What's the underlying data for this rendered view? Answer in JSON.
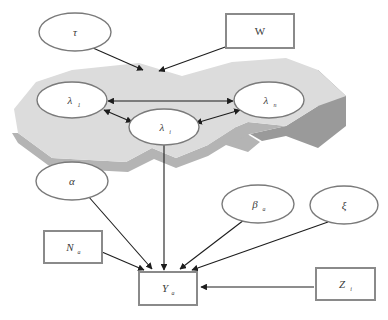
{
  "diagram": {
    "type": "directed-acyclic-graph",
    "canvas": {
      "width": 388,
      "height": 320
    },
    "colors": {
      "background": "#ffffff",
      "plate_top": "#dcdcdc",
      "plate_side": "#b4b4b4",
      "plate_side_dark": "#9a9a9a",
      "node_stroke": "#7a7a7a",
      "box_stroke": "#8a8a8a",
      "edge": "#1d1d1d",
      "label": "#3b3b3b"
    },
    "plate": {
      "name": "spatial-field-plate",
      "shape": "polygon-3d-extruded"
    },
    "nodes": [
      {
        "id": "tau",
        "shape": "ellipse",
        "base": "τ",
        "subscript": "",
        "cx": 75,
        "cy": 32,
        "rx": 36,
        "ry": 19
      },
      {
        "id": "W",
        "shape": "rect",
        "base": "W",
        "subscript": "",
        "x": 226,
        "y": 14,
        "w": 68,
        "h": 34
      },
      {
        "id": "lambda_1",
        "shape": "ellipse",
        "base": "λ",
        "subscript": "1",
        "cx": 72,
        "cy": 100,
        "rx": 35,
        "ry": 18
      },
      {
        "id": "lambda_n",
        "shape": "ellipse",
        "base": "λ",
        "subscript": "n",
        "cx": 269,
        "cy": 100,
        "rx": 35,
        "ry": 18
      },
      {
        "id": "lambda_i",
        "shape": "ellipse",
        "base": "λ",
        "subscript": "i",
        "cx": 164,
        "cy": 127,
        "rx": 35,
        "ry": 18
      },
      {
        "id": "alpha",
        "shape": "ellipse",
        "base": "α",
        "subscript": "",
        "cx": 72,
        "cy": 181,
        "rx": 36,
        "ry": 19
      },
      {
        "id": "beta_a",
        "shape": "ellipse",
        "base": "β",
        "subscript": "a",
        "cx": 258,
        "cy": 204,
        "rx": 36,
        "ry": 19
      },
      {
        "id": "xi",
        "shape": "ellipse",
        "base": "ξ",
        "subscript": "",
        "cx": 344,
        "cy": 205,
        "rx": 34,
        "ry": 19
      },
      {
        "id": "N_a",
        "shape": "rect",
        "base": "N",
        "subscript": "a",
        "x": 44,
        "y": 231,
        "w": 58,
        "h": 32
      },
      {
        "id": "Y_a",
        "shape": "rect",
        "base": "Y",
        "subscript": "a",
        "x": 139,
        "y": 272,
        "w": 58,
        "h": 33
      },
      {
        "id": "Z_i",
        "shape": "rect",
        "base": "Z",
        "subscript": "i",
        "x": 316,
        "y": 268,
        "w": 59,
        "h": 32
      }
    ],
    "edges": [
      {
        "from": "tau",
        "to": "plate-top",
        "kind": "directed"
      },
      {
        "from": "W",
        "to": "plate-top",
        "kind": "directed"
      },
      {
        "from": "lambda_1",
        "to": "lambda_n",
        "kind": "bidirectional"
      },
      {
        "from": "lambda_1",
        "to": "lambda_i",
        "kind": "bidirectional"
      },
      {
        "from": "lambda_i",
        "to": "lambda_n",
        "kind": "bidirectional"
      },
      {
        "from": "lambda_i",
        "to": "Y_a",
        "kind": "directed"
      },
      {
        "from": "alpha",
        "to": "Y_a",
        "kind": "directed"
      },
      {
        "from": "N_a",
        "to": "Y_a",
        "kind": "directed"
      },
      {
        "from": "beta_a",
        "to": "Y_a",
        "kind": "directed"
      },
      {
        "from": "xi",
        "to": "Y_a",
        "kind": "directed"
      },
      {
        "from": "Z_i",
        "to": "Y_a",
        "kind": "directed"
      }
    ]
  }
}
